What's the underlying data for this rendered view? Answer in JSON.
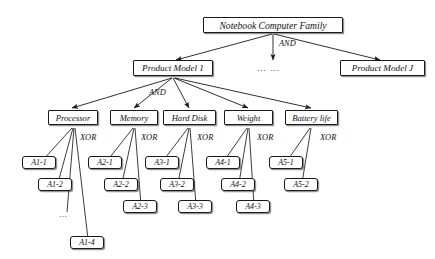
{
  "diagram": {
    "title_node": "Notebook Computer Family",
    "levels": {
      "root": {
        "label": "Notebook Computer Family",
        "op": "AND"
      },
      "models": {
        "op": "AND",
        "items": [
          {
            "label": "Product Model 1"
          },
          {
            "label": "… …"
          },
          {
            "label": "Product Model J"
          }
        ]
      },
      "features": {
        "items": [
          {
            "label": "Processor",
            "op": "XOR"
          },
          {
            "label": "Memory",
            "op": "XOR"
          },
          {
            "label": "Hard Disk",
            "op": "XOR"
          },
          {
            "label": "Weight",
            "op": "XOR"
          },
          {
            "label": "Battery life",
            "op": "XOR"
          }
        ]
      },
      "leaves": {
        "processor": [
          "A1-1",
          "A1-2",
          "…",
          "A1-4"
        ],
        "memory": [
          "A2-1",
          "A2-2",
          "A2-3"
        ],
        "harddisk": [
          "A3-1",
          "A3-2",
          "A3-3"
        ],
        "weight": [
          "A4-1",
          "A4-2",
          "A4-3"
        ],
        "batterylife": [
          "A5-1",
          "A5-2"
        ]
      }
    },
    "colors": {
      "line": "#1a1a1a",
      "box_border": "#1a1a1a",
      "box_fill": "#ffffff",
      "text": "#101010",
      "background": "#ffffff"
    }
  }
}
